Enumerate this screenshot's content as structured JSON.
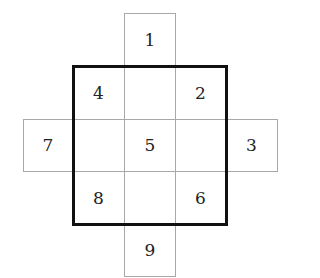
{
  "diagram": {
    "grid": {
      "col_edges": [
        23,
        73,
        124,
        175,
        226,
        277
      ],
      "row_edges": [
        13,
        66,
        119,
        171,
        224,
        276
      ]
    },
    "cells": [
      {
        "label": "1",
        "row": 0,
        "col": 2
      },
      {
        "label": "4",
        "row": 1,
        "col": 1
      },
      {
        "label": "2",
        "row": 1,
        "col": 3
      },
      {
        "label": "7",
        "row": 2,
        "col": 0
      },
      {
        "label": "5",
        "row": 2,
        "col": 2
      },
      {
        "label": "3",
        "row": 2,
        "col": 4
      },
      {
        "label": "8",
        "row": 3,
        "col": 1
      },
      {
        "label": "6",
        "row": 3,
        "col": 3
      },
      {
        "label": "9",
        "row": 4,
        "col": 2
      }
    ],
    "bold_square": {
      "from_col": 1,
      "to_col": 3,
      "from_row": 1,
      "to_row": 3
    },
    "colors": {
      "thin_line": "#a8a8a8",
      "bold_line": "#111111",
      "text": "#222222"
    }
  }
}
